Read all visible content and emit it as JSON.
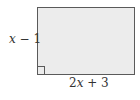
{
  "diagram": {
    "shape": "rectangle",
    "fill_color": "#ececec",
    "stroke_color": "#5a5a5a",
    "side_label": {
      "var": "x",
      "rest": " − 1"
    },
    "bottom_label": {
      "coef": "2",
      "var": "x",
      "rest": " + 3"
    },
    "right_angle_marker": "bottom-left"
  }
}
